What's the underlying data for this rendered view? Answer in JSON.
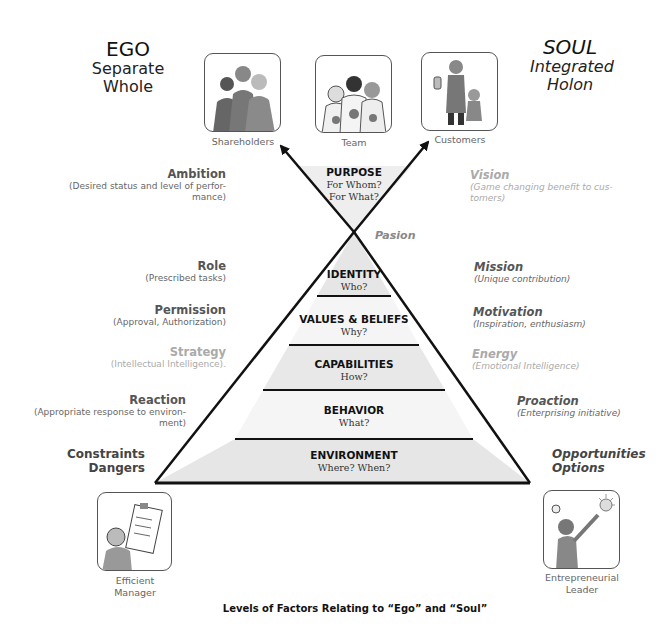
{
  "headers": {
    "ego": {
      "title": "EGO",
      "line1": "Separate",
      "line2": "Whole"
    },
    "soul": {
      "title": "SOUL",
      "line1": "Integrated",
      "line2": "Holon"
    }
  },
  "top_images": [
    {
      "caption": "Shareholders",
      "icon": "shareholders-illustration"
    },
    {
      "caption": "Team",
      "icon": "team-illustration"
    },
    {
      "caption": "Customers",
      "icon": "customers-illustration"
    }
  ],
  "purpose": {
    "name": "PURPOSE",
    "q1": "For Whom?",
    "q2": "For What?"
  },
  "pasion": "Pasion",
  "pyramid_levels": [
    {
      "name": "IDENTITY",
      "question": "Who?"
    },
    {
      "name": "VALUES & BELIEFS",
      "question": "Why?"
    },
    {
      "name": "CAPABILITIES",
      "question": "How?"
    },
    {
      "name": "BEHAVIOR",
      "question": "What?"
    },
    {
      "name": "ENVIRONMENT",
      "question": "Where? When?"
    }
  ],
  "left_labels": [
    {
      "title": "Ambition",
      "sub": "(Desired status and level of perfor-",
      "sub2": "mance)"
    },
    {
      "title": "Role",
      "sub": "(Prescribed tasks)"
    },
    {
      "title": "Permission",
      "sub": "(Approval, Authorization)"
    },
    {
      "title": "Strategy",
      "sub": "(Intellectual Intelligence)."
    },
    {
      "title": "Reaction",
      "sub": "(Appropriate response to environ-",
      "sub2": "ment)"
    },
    {
      "title": "Constraints",
      "sub": "Dangers"
    }
  ],
  "right_labels": [
    {
      "title": "Vision",
      "sub": "(Game changing benefit to cus-",
      "sub2": "tomers)"
    },
    {
      "title": "Mission",
      "sub": "(Unique contribution)"
    },
    {
      "title": "Motivation",
      "sub": "(Inspiration, enthusiasm)"
    },
    {
      "title": "Energy",
      "sub": "(Emotional Intelligence)"
    },
    {
      "title": "Proaction",
      "sub": "(Enterprising initiative)"
    },
    {
      "title": "Opportunities",
      "sub": "Options"
    }
  ],
  "bottom_images": [
    {
      "line1": "Efficient",
      "line2": "Manager",
      "icon": "efficient-manager-illustration"
    },
    {
      "line1": "Entrepreneurial",
      "line2": "Leader",
      "icon": "entrepreneurial-leader-illustration"
    }
  ],
  "caption": "Levels of Factors Relating to “Ego” and “Soul”",
  "colors": {
    "band_fill_dark": "#e6e6e6",
    "band_fill_light": "#f4f4f4",
    "line": "#111111",
    "faded_text": "#aaaaaa"
  }
}
